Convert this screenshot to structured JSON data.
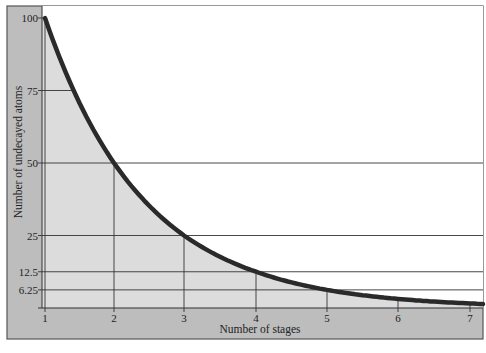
{
  "chart_data": {
    "type": "line",
    "title": "",
    "xlabel": "Number of stages",
    "ylabel": "Number of undecayed atoms",
    "x": [
      1,
      2,
      3,
      4,
      5,
      6,
      7
    ],
    "series": [
      {
        "name": "Undecayed atoms",
        "values": [
          100,
          50,
          25,
          12.5,
          6.25,
          3.125,
          1.5625
        ]
      }
    ],
    "x_ticks": [
      "1",
      "2",
      "3",
      "4",
      "5",
      "6",
      "7"
    ],
    "y_ticks": [
      "100",
      "75",
      "50",
      "25",
      "12.5",
      "6.25"
    ],
    "xlim": [
      1,
      7
    ],
    "ylim": [
      0,
      100
    ],
    "grid": false,
    "legend": null,
    "reference_lines": [
      {
        "y": 50,
        "x": 2
      },
      {
        "y": 25,
        "x": 3
      },
      {
        "y": 12.5,
        "x": 4
      },
      {
        "y": 6.25,
        "x": 5
      }
    ],
    "style": {
      "frame_band_color": "#bdbdbd",
      "area_fill_color": "#dcdcdc",
      "curve_color": "#2a2a2a",
      "background": "#ffffff"
    }
  }
}
